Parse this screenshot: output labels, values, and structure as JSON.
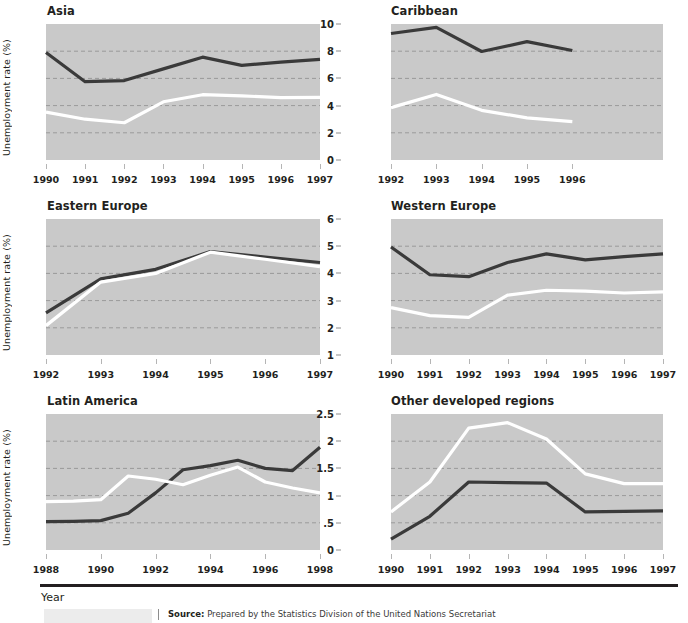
{
  "footer": {
    "year_label": "Year",
    "source_prefix": "Source:",
    "source_text": "Prepared by the Statistics Division of the United Nations Secretariat"
  },
  "style": {
    "plot_background": "#c9c9c9",
    "dark_line": "#3a3a3a",
    "light_line": "#ffffff",
    "gridline": "#9a9a9a",
    "text": "#231f20"
  },
  "common": {
    "ylabel": "Unemployment rate (%)",
    "legend_series": [
      "Male",
      "Female"
    ]
  },
  "chart_data": [
    {
      "type": "line",
      "title": "Asia",
      "xlabel": "Year",
      "ylabel": "Unemployment rate (%)",
      "ylim": [
        1,
        6
      ],
      "yticks": [
        1,
        2,
        3,
        4,
        5,
        6
      ],
      "ytick_labels": [
        "1",
        "2",
        "3",
        "4",
        "5",
        "6"
      ],
      "gridlines": [
        2,
        3,
        4,
        5
      ],
      "xlim": [
        1990,
        1997
      ],
      "xticks": [
        1990,
        1991,
        1992,
        1993,
        1994,
        1995,
        1996,
        1997
      ],
      "xtick_labels": [
        "1990",
        "1991",
        "1992",
        "1993",
        "1994",
        "1995",
        "1996",
        "1997"
      ],
      "x": [
        1990,
        1991,
        1992,
        1993,
        1994,
        1995,
        1996,
        1997
      ],
      "series": [
        {
          "name": "dark",
          "color": "#3a3a3a",
          "values": [
            4.95,
            3.88,
            3.92,
            4.35,
            4.78,
            4.48,
            4.6,
            4.7
          ]
        },
        {
          "name": "light",
          "color": "#ffffff",
          "values": [
            2.76,
            2.5,
            2.37,
            3.14,
            3.4,
            3.36,
            3.29,
            3.3
          ]
        }
      ]
    },
    {
      "type": "line",
      "title": "Caribbean",
      "xlabel": "Year",
      "ylabel": "",
      "ylim": [
        0,
        10
      ],
      "yticks": [
        0,
        2,
        4,
        6,
        8,
        10
      ],
      "ytick_labels": [
        "0",
        "2",
        "4",
        "6",
        "8",
        "10"
      ],
      "gridlines": [
        2,
        4,
        6,
        8
      ],
      "xlim": [
        1992,
        1998
      ],
      "xticks": [
        1992,
        1993,
        1994,
        1995,
        1996
      ],
      "xtick_labels": [
        "1992",
        "1993",
        "1994",
        "1995",
        "1996"
      ],
      "x": [
        1992,
        1993,
        1994,
        1995,
        1996
      ],
      "series": [
        {
          "name": "dark",
          "color": "#3a3a3a",
          "values": [
            9.3,
            9.75,
            7.98,
            8.7,
            8.05
          ]
        },
        {
          "name": "light",
          "color": "#ffffff",
          "values": [
            3.85,
            4.82,
            3.65,
            3.1,
            2.82
          ]
        }
      ]
    },
    {
      "type": "line",
      "title": "Eastern Europe",
      "xlabel": "Year",
      "ylabel": "Unemployment rate (%)",
      "ylim": [
        1,
        6
      ],
      "yticks": [
        1,
        2,
        3,
        4,
        5,
        6
      ],
      "ytick_labels": [
        "1",
        "2",
        "3",
        "4",
        "5",
        "6"
      ],
      "gridlines": [
        2,
        3,
        4,
        5
      ],
      "xlim": [
        1992,
        1997
      ],
      "xticks": [
        1992,
        1993,
        1994,
        1995,
        1996,
        1997
      ],
      "xtick_labels": [
        "1992",
        "1993",
        "1994",
        "1995",
        "1996",
        "1997"
      ],
      "x": [
        1992,
        1993,
        1994,
        1995,
        1996,
        1997
      ],
      "series": [
        {
          "name": "dark",
          "color": "#3a3a3a",
          "values": [
            2.55,
            3.8,
            4.15,
            4.8,
            4.6,
            4.4
          ]
        },
        {
          "name": "light",
          "color": "#ffffff",
          "values": [
            2.08,
            3.68,
            4.0,
            4.78,
            4.52,
            4.25
          ]
        }
      ]
    },
    {
      "type": "line",
      "title": "Western Europe",
      "xlabel": "Year",
      "ylabel": "",
      "ylim": [
        1,
        6
      ],
      "yticks": [
        1,
        2,
        3,
        4,
        5,
        6
      ],
      "ytick_labels": [
        "1",
        "2",
        "3",
        "4",
        "5",
        "6"
      ],
      "gridlines": [
        2,
        3,
        4,
        5
      ],
      "xlim": [
        1990,
        1997
      ],
      "xticks": [
        1990,
        1991,
        1992,
        1993,
        1994,
        1995,
        1996,
        1997
      ],
      "xtick_labels": [
        "1990",
        "1991",
        "1992",
        "1993",
        "1994",
        "1995",
        "1996",
        "1997"
      ],
      "x": [
        1990,
        1991,
        1992,
        1993,
        1994,
        1995,
        1996,
        1997
      ],
      "series": [
        {
          "name": "dark",
          "color": "#3a3a3a",
          "values": [
            4.97,
            3.95,
            3.88,
            4.4,
            4.72,
            4.5,
            4.62,
            4.72
          ]
        },
        {
          "name": "light",
          "color": "#ffffff",
          "values": [
            2.74,
            2.45,
            2.38,
            3.2,
            3.38,
            3.35,
            3.28,
            3.32
          ]
        }
      ]
    },
    {
      "type": "line",
      "title": "Latin America",
      "xlabel": "Year",
      "ylabel": "Unemployment rate (%)",
      "ylim": [
        1,
        6
      ],
      "yticks": [
        1,
        2,
        3,
        4,
        5,
        6
      ],
      "ytick_labels": [
        "1",
        "2",
        "3",
        "4",
        "5",
        "6"
      ],
      "gridlines": [
        2,
        3,
        4,
        5
      ],
      "xlim": [
        1988,
        1998
      ],
      "xticks": [
        1988,
        1990,
        1992,
        1994,
        1996,
        1998
      ],
      "xtick_labels": [
        "1988",
        "1990",
        "1992",
        "1994",
        "1996",
        "1998"
      ],
      "x": [
        1988,
        1989,
        1990,
        1991,
        1992,
        1993,
        1994,
        1995,
        1996,
        1997,
        1998
      ],
      "series": [
        {
          "name": "dark",
          "color": "#3a3a3a",
          "values": [
            2.04,
            2.05,
            2.08,
            2.35,
            3.1,
            3.95,
            4.1,
            4.3,
            4.0,
            3.92,
            4.78
          ]
        },
        {
          "name": "light",
          "color": "#ffffff",
          "values": [
            2.78,
            2.8,
            2.85,
            3.72,
            3.6,
            3.4,
            3.75,
            4.05,
            3.5,
            3.28,
            3.1
          ]
        }
      ]
    },
    {
      "type": "line",
      "title": "Other developed regions",
      "xlabel": "Year",
      "ylabel": "",
      "ylim": [
        0,
        2.5
      ],
      "yticks": [
        0,
        0.5,
        1,
        1.5,
        2,
        2.5
      ],
      "ytick_labels": [
        "0",
        ".5",
        "1",
        "1.5",
        "2",
        "2.5"
      ],
      "gridlines": [
        0.5,
        1,
        1.5,
        2
      ],
      "xlim": [
        1990,
        1997
      ],
      "xticks": [
        1990,
        1991,
        1992,
        1993,
        1994,
        1995,
        1996,
        1997
      ],
      "xtick_labels": [
        "1990",
        "1991",
        "1992",
        "1993",
        "1994",
        "1995",
        "1996",
        "1997"
      ],
      "x": [
        1990,
        1991,
        1992,
        1993,
        1994,
        1995,
        1996,
        1997
      ],
      "series": [
        {
          "name": "dark",
          "color": "#3a3a3a",
          "values": [
            0.2,
            0.62,
            1.25,
            1.24,
            1.23,
            0.7,
            0.71,
            0.72
          ]
        },
        {
          "name": "light",
          "color": "#ffffff",
          "values": [
            0.7,
            1.25,
            2.24,
            2.34,
            2.04,
            1.4,
            1.22,
            1.22
          ]
        }
      ]
    }
  ]
}
